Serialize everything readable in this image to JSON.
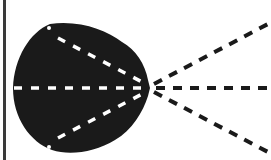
{
  "diagram": {
    "colors": {
      "background": "#ffffff",
      "blob": "#1a1a1a",
      "inner_dashes": "#ffffff",
      "outer_dashes": "#1a1a1a",
      "left_border": "#3a3a3a"
    },
    "focal_point": {
      "x": 150,
      "y": 88
    },
    "inner_lines": 3,
    "outer_rays": 3
  }
}
